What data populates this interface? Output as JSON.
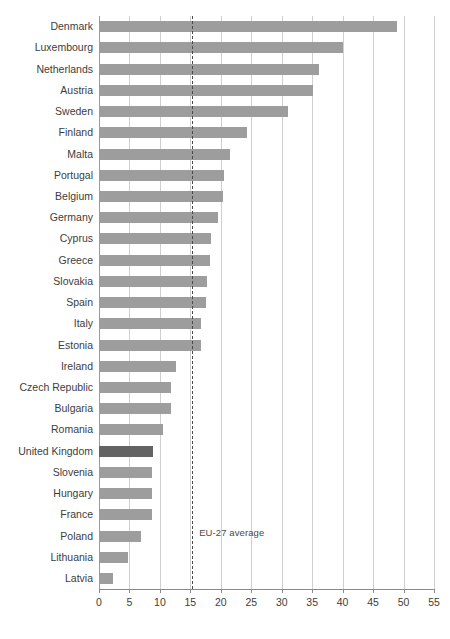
{
  "chart_data": {
    "type": "bar",
    "orientation": "horizontal",
    "title": "",
    "subtitle": "",
    "xlabel": "",
    "ylabel": "",
    "xlim": [
      0,
      55
    ],
    "xticks": [
      0,
      5,
      10,
      15,
      20,
      25,
      30,
      35,
      40,
      45,
      50,
      55
    ],
    "grid": true,
    "legend": null,
    "categories": [
      "Denmark",
      "Luxembourg",
      "Netherlands",
      "Austria",
      "Sweden",
      "Finland",
      "Malta",
      "Portugal",
      "Belgium",
      "Germany",
      "Cyprus",
      "Greece",
      "Slovakia",
      "Spain",
      "Italy",
      "Estonia",
      "Ireland",
      "Czech Republic",
      "Bulgaria",
      "Romania",
      "United Kingdom",
      "Slovenia",
      "Hungary",
      "France",
      "Poland",
      "Lithuania",
      "Latvia"
    ],
    "values": [
      49.0,
      40.0,
      36.1,
      35.2,
      31.0,
      24.3,
      21.5,
      20.6,
      20.4,
      19.6,
      18.4,
      18.3,
      17.7,
      17.6,
      16.8,
      16.7,
      12.7,
      11.9,
      11.8,
      10.5,
      8.9,
      8.7,
      8.7,
      8.7,
      6.9,
      4.8,
      2.3
    ],
    "highlight_category": "United Kingdom",
    "annotations": [
      {
        "label": "EU-27 average",
        "value": 15.3,
        "style": "dashed-vertical-line"
      }
    ],
    "colors": {
      "bar": "#9d9d9d",
      "bar_highlight": "#636363",
      "gridline": "#cfcfcf",
      "axis": "#8a8a8a",
      "annotation_line": "#4a4a4a",
      "text": "#3d3d3d",
      "background": "#ffffff"
    }
  }
}
